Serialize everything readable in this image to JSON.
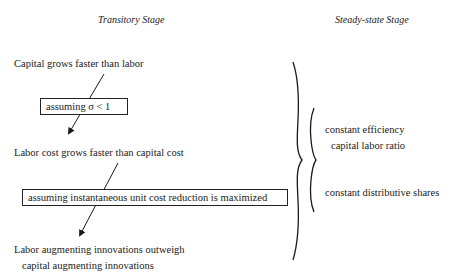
{
  "headers": {
    "left": "Transitory Stage",
    "right": "Steady-state Stage"
  },
  "transitory": {
    "step1": "Capital grows faster than labor",
    "assumption1": "assuming σ < 1",
    "step2": "Labor cost grows faster than capital cost",
    "assumption2": "assuming instantaneous unit cost reduction is maximized",
    "step3_line1": "Labor augmenting innovations outweigh",
    "step3_line2": "capital augmenting innovations"
  },
  "steady_state": {
    "item1_line1": "constant efficiency",
    "item1_line2": "capital labor ratio",
    "item2": "constant distributive shares"
  },
  "colors": {
    "ink": "#1a1a1a",
    "background": "#ffffff"
  }
}
